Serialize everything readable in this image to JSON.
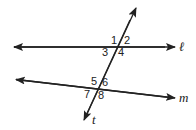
{
  "diagram": {
    "type": "parallel-lines-transversal",
    "lines": {
      "l": {
        "label": "ℓ"
      },
      "m": {
        "label": "m"
      },
      "t": {
        "label": "t"
      }
    },
    "angles": [
      {
        "id": "1",
        "label": "1"
      },
      {
        "id": "2",
        "label": "2"
      },
      {
        "id": "3",
        "label": "3"
      },
      {
        "id": "4",
        "label": "4"
      },
      {
        "id": "5",
        "label": "5"
      },
      {
        "id": "6",
        "label": "6"
      },
      {
        "id": "7",
        "label": "7"
      },
      {
        "id": "8",
        "label": "8"
      }
    ],
    "stroke_color": "#222222"
  }
}
